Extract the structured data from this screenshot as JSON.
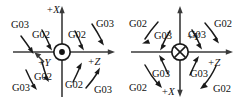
{
  "figure": {
    "background_color": "#ffffff",
    "ink_color": "#111111",
    "axis_color": "#3a3a3a"
  },
  "diagrams": [
    {
      "id": "left",
      "name": "arc-direction-diagram-xz-plane",
      "center_symbol": "circle-dot-icon",
      "center_symbol_meaning": "axis-out-of-page",
      "axes": [
        {
          "name": "axis-up",
          "label": "+X",
          "direction": "up"
        },
        {
          "name": "axis-right",
          "label": "+Z",
          "direction": "right"
        },
        {
          "name": "axis-oblique",
          "label": "+Y",
          "direction": "up-left"
        }
      ],
      "quadrants": [
        {
          "name": "top-left",
          "outer": "G03",
          "inner": "G02"
        },
        {
          "name": "top-right",
          "outer": "G03",
          "inner": "G02"
        },
        {
          "name": "bottom-left",
          "outer": "G03",
          "inner": "G02"
        },
        {
          "name": "bottom-right",
          "outer": "G03",
          "inner": "G02"
        }
      ]
    },
    {
      "id": "right",
      "name": "arc-direction-diagram-yz-plane",
      "center_symbol": "circle-cross-icon",
      "center_symbol_meaning": "axis-into-page",
      "axes": [
        {
          "name": "axis-up",
          "label": "+Y",
          "direction": "up"
        },
        {
          "name": "axis-right",
          "label": "+Z",
          "direction": "right"
        },
        {
          "name": "axis-down",
          "label": "+X",
          "direction": "down"
        }
      ],
      "quadrants": [
        {
          "name": "top-left",
          "outer": "G02",
          "inner": "G03"
        },
        {
          "name": "top-right",
          "outer": "G02",
          "inner": "G03"
        },
        {
          "name": "bottom-left",
          "outer": "G02",
          "inner": "G03"
        },
        {
          "name": "bottom-right",
          "outer": "G02",
          "inner": "G03"
        }
      ]
    }
  ]
}
